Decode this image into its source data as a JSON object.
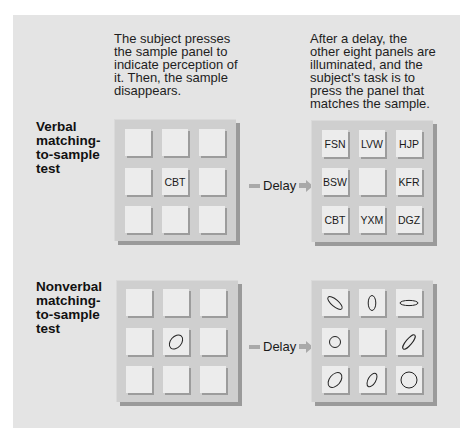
{
  "captions": {
    "sample_step": "The subject presses the sample panel to indicate perception of it. Then, the sample disappears.",
    "choice_step": "After a delay, the other eight panels are illuminated, and the subject's task is to press the panel that matches the sample."
  },
  "delay_label": "Delay",
  "colors": {
    "background": "#e4e4e4",
    "board": "#cfcfcf",
    "panel": "#ececec",
    "shadow": "#9a9a9a",
    "arrow": "#a9a9a9"
  },
  "verbal_test": {
    "label": "Verbal matching-to-sample test",
    "sample_board": [
      "",
      "",
      "",
      "",
      "CBT",
      "",
      "",
      "",
      ""
    ],
    "choice_board": [
      "FSN",
      "LVW",
      "HJP",
      "BSW",
      "",
      "KFR",
      "CBT",
      "YXM",
      "DGZ"
    ]
  },
  "nonverbal_test": {
    "label": "Nonverbal matching-to-sample test",
    "sample_board": [
      "",
      "",
      "",
      "",
      "ellipse-tilted-right",
      "",
      "",
      "",
      ""
    ],
    "choice_board": [
      "ellipse-diagonal-down",
      "ellipse-vertical",
      "ellipse-horizontal-flat",
      "circle-small",
      "",
      "ellipse-narrow-tilted-right",
      "ellipse-tilted-right",
      "ellipse-narrow-tilted-right-small",
      "circle-large"
    ]
  }
}
